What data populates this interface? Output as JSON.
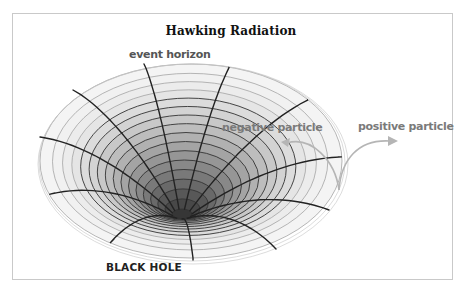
{
  "title": "Hawking Radiation",
  "labels": {
    "event_horizon": "event horizon",
    "negative_particle": "negative particle",
    "positive_particle": "positive particle",
    "black_hole": "BLACK HOLE"
  },
  "colors": {
    "frame_border": "#c9c9c9",
    "radial_line": "#222222",
    "ring_dark": "#333333",
    "ring_light": "#9a9a9a",
    "arrow": "#b5b5b5",
    "label_gray": "#7a7a7a"
  },
  "funnel": {
    "outer": {
      "cx": 191,
      "cy": 161,
      "rx": 151,
      "ry": 97
    },
    "throat": {
      "cx": 182,
      "cy": 214,
      "rx": 10,
      "ry": 5
    },
    "ring_count": 16,
    "light_outer_rings": 4,
    "radial_lines": [
      {
        "end": [
          73,
          90
        ]
      },
      {
        "end": [
          144,
          64
        ]
      },
      {
        "end": [
          228,
          70
        ]
      },
      {
        "end": [
          300,
          104
        ]
      },
      {
        "end": [
          338,
          157
        ]
      },
      {
        "end": [
          329,
          210
        ]
      },
      {
        "end": [
          276,
          249
        ]
      },
      {
        "end": [
          193,
          260
        ]
      },
      {
        "end": [
          114,
          239
        ]
      },
      {
        "end": [
          55,
          193
        ]
      },
      {
        "end": [
          40,
          137
        ]
      }
    ]
  },
  "arrows": {
    "origin": [
      339,
      190
    ],
    "negative_tip": [
      281,
      142
    ],
    "positive_tip": [
      398,
      141
    ]
  }
}
